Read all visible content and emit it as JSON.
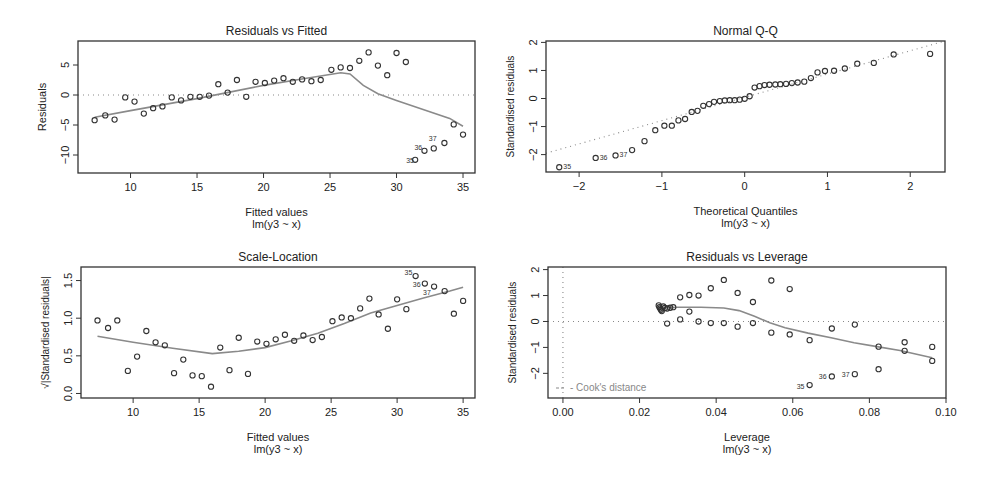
{
  "chart_data": [
    {
      "id": "resid_fitted",
      "type": "scatter",
      "title": "Residuals vs Fitted",
      "xlabel": "Fitted values",
      "sublabel": "lm(y3 ~ x)",
      "ylabel": "Residuals",
      "frame": {
        "left": 78,
        "top": 41,
        "right": 475,
        "bottom": 173
      },
      "xlim": [
        6.05,
        35.9
      ],
      "ylim": [
        -13,
        9
      ],
      "xticks": [
        10,
        15,
        20,
        25,
        30,
        35
      ],
      "yticks": [
        5,
        0,
        -5,
        -10
      ],
      "ytick_labels": [
        "5",
        "0",
        "-5",
        "-10"
      ],
      "hline": 0,
      "points": [
        [
          7.3,
          -4.2
        ],
        [
          8.1,
          -3.4
        ],
        [
          8.8,
          -4.1
        ],
        [
          9.6,
          -0.4
        ],
        [
          10.3,
          -1.1
        ],
        [
          11.0,
          -3.1
        ],
        [
          11.7,
          -2.2
        ],
        [
          12.4,
          -1.9
        ],
        [
          13.1,
          -0.4
        ],
        [
          13.8,
          -0.9
        ],
        [
          14.5,
          -0.3
        ],
        [
          15.2,
          -0.3
        ],
        [
          15.9,
          -0.1
        ],
        [
          16.6,
          1.8
        ],
        [
          17.3,
          0.4
        ],
        [
          18.0,
          2.5
        ],
        [
          18.7,
          -0.3
        ],
        [
          19.4,
          2.2
        ],
        [
          20.1,
          2.0
        ],
        [
          20.8,
          2.4
        ],
        [
          21.5,
          2.8
        ],
        [
          22.2,
          2.2
        ],
        [
          22.9,
          2.6
        ],
        [
          23.6,
          2.3
        ],
        [
          24.3,
          2.5
        ],
        [
          25.1,
          4.2
        ],
        [
          25.8,
          4.6
        ],
        [
          26.5,
          4.5
        ],
        [
          27.2,
          5.7
        ],
        [
          27.9,
          7.1
        ],
        [
          28.6,
          4.9
        ],
        [
          29.3,
          3.3
        ],
        [
          30.0,
          7.0
        ],
        [
          30.7,
          5.5
        ],
        [
          31.4,
          -10.8
        ],
        [
          32.1,
          -9.3
        ],
        [
          32.8,
          -8.9
        ],
        [
          33.6,
          -8.0
        ],
        [
          34.3,
          -4.9
        ],
        [
          35.0,
          -6.6
        ]
      ],
      "labels": [
        {
          "idx": 34,
          "text": "35",
          "dx": -9,
          "dy": 3
        },
        {
          "idx": 35,
          "text": "36",
          "dx": -10,
          "dy": -1
        },
        {
          "idx": 36,
          "text": "37",
          "dx": -5,
          "dy": -7
        }
      ],
      "smooth": [
        [
          7.3,
          -3.7
        ],
        [
          10,
          -2.6
        ],
        [
          15,
          -0.6
        ],
        [
          20,
          1.6
        ],
        [
          23,
          2.7
        ],
        [
          25.8,
          3.7
        ],
        [
          26.5,
          3.5
        ],
        [
          27.5,
          1.6
        ],
        [
          28.6,
          0.2
        ],
        [
          30,
          -0.9
        ],
        [
          32,
          -2.4
        ],
        [
          34,
          -3.9
        ],
        [
          35,
          -5.2
        ]
      ]
    },
    {
      "id": "normal_qq",
      "type": "scatter",
      "title": "Normal Q-Q",
      "xlabel": "Theoretical Quantiles",
      "sublabel": "lm(y3 ~ x)",
      "ylabel": "Standardised residuals",
      "frame": {
        "left": 546,
        "top": 41,
        "right": 945,
        "bottom": 172
      },
      "xlim": [
        -2.4,
        2.42
      ],
      "ylim": [
        -2.62,
        2.05
      ],
      "xticks": [
        -2,
        -1,
        0,
        1,
        2
      ],
      "yticks": [
        2,
        1,
        0,
        -1,
        -2
      ],
      "ytick_labels": [
        "2",
        "1",
        "0",
        "-1",
        "-2"
      ],
      "refline": [
        [
          -2.4,
          -1.95
        ],
        [
          2.42,
          2.05
        ]
      ],
      "points": [
        [
          -2.24,
          -2.45
        ],
        [
          -1.8,
          -2.12
        ],
        [
          -1.56,
          -2.03
        ],
        [
          -1.36,
          -1.84
        ],
        [
          -1.21,
          -1.52
        ],
        [
          -1.08,
          -1.13
        ],
        [
          -0.97,
          -0.97
        ],
        [
          -0.88,
          -0.97
        ],
        [
          -0.8,
          -0.78
        ],
        [
          -0.72,
          -0.73
        ],
        [
          -0.64,
          -0.48
        ],
        [
          -0.57,
          -0.44
        ],
        [
          -0.5,
          -0.26
        ],
        [
          -0.43,
          -0.2
        ],
        [
          -0.37,
          -0.12
        ],
        [
          -0.3,
          -0.09
        ],
        [
          -0.24,
          -0.07
        ],
        [
          -0.18,
          -0.06
        ],
        [
          -0.12,
          -0.06
        ],
        [
          -0.06,
          -0.04
        ],
        [
          0.0,
          -0.01
        ],
        [
          0.06,
          0.08
        ],
        [
          0.12,
          0.39
        ],
        [
          0.18,
          0.44
        ],
        [
          0.24,
          0.48
        ],
        [
          0.3,
          0.49
        ],
        [
          0.37,
          0.5
        ],
        [
          0.43,
          0.51
        ],
        [
          0.5,
          0.52
        ],
        [
          0.57,
          0.55
        ],
        [
          0.64,
          0.57
        ],
        [
          0.72,
          0.6
        ],
        [
          0.8,
          0.73
        ],
        [
          0.88,
          0.93
        ],
        [
          0.97,
          0.98
        ],
        [
          1.08,
          0.99
        ],
        [
          1.21,
          1.07
        ],
        [
          1.36,
          1.24
        ],
        [
          1.56,
          1.27
        ],
        [
          1.8,
          1.57
        ],
        [
          2.24,
          1.59
        ]
      ],
      "labels": [
        {
          "idx": 0,
          "text": "35",
          "dx": 4,
          "dy": 2
        },
        {
          "idx": 1,
          "text": "36",
          "dx": 4,
          "dy": 2
        },
        {
          "idx": 2,
          "text": "37",
          "dx": 4,
          "dy": 2
        }
      ]
    },
    {
      "id": "scale_location",
      "type": "scatter",
      "title": "Scale-Location",
      "xlabel": "Fitted values",
      "sublabel": "lm(y3 ~ x)",
      "ylabel": "√|Standardised residuals|",
      "frame": {
        "left": 81,
        "top": 267,
        "right": 475,
        "bottom": 398
      },
      "xlim": [
        6.05,
        35.9
      ],
      "ylim": [
        -0.06,
        1.68
      ],
      "xticks": [
        10,
        15,
        20,
        25,
        30,
        35
      ],
      "yticks": [
        0.0,
        0.5,
        1.0,
        1.5
      ],
      "ytick_labels": [
        "0.0",
        "0.5",
        "1.0",
        "1.5"
      ],
      "points": [
        [
          7.3,
          0.97
        ],
        [
          8.1,
          0.87
        ],
        [
          8.8,
          0.97
        ],
        [
          9.6,
          0.3
        ],
        [
          10.3,
          0.49
        ],
        [
          11.0,
          0.83
        ],
        [
          11.7,
          0.68
        ],
        [
          12.4,
          0.64
        ],
        [
          13.1,
          0.27
        ],
        [
          13.8,
          0.45
        ],
        [
          14.5,
          0.24
        ],
        [
          15.2,
          0.23
        ],
        [
          15.9,
          0.09
        ],
        [
          16.6,
          0.61
        ],
        [
          17.3,
          0.31
        ],
        [
          18.0,
          0.74
        ],
        [
          18.7,
          0.26
        ],
        [
          19.4,
          0.69
        ],
        [
          20.1,
          0.66
        ],
        [
          20.8,
          0.72
        ],
        [
          21.5,
          0.78
        ],
        [
          22.2,
          0.7
        ],
        [
          22.9,
          0.77
        ],
        [
          23.6,
          0.71
        ],
        [
          24.3,
          0.75
        ],
        [
          25.1,
          0.96
        ],
        [
          25.8,
          1.01
        ],
        [
          26.5,
          1.0
        ],
        [
          27.2,
          1.13
        ],
        [
          27.9,
          1.26
        ],
        [
          28.6,
          1.05
        ],
        [
          29.3,
          0.86
        ],
        [
          30.0,
          1.25
        ],
        [
          30.7,
          1.12
        ],
        [
          31.4,
          1.56
        ],
        [
          32.1,
          1.46
        ],
        [
          32.8,
          1.42
        ],
        [
          33.6,
          1.36
        ],
        [
          34.3,
          1.06
        ],
        [
          35.0,
          1.23
        ]
      ],
      "labels": [
        {
          "idx": 34,
          "text": "35",
          "dx": -11,
          "dy": -1
        },
        {
          "idx": 35,
          "text": "36",
          "dx": -12,
          "dy": 3
        },
        {
          "idx": 36,
          "text": "37",
          "dx": -11,
          "dy": 8
        }
      ],
      "smooth": [
        [
          7.3,
          0.76
        ],
        [
          10,
          0.68
        ],
        [
          13,
          0.6
        ],
        [
          16,
          0.53
        ],
        [
          18,
          0.56
        ],
        [
          20,
          0.61
        ],
        [
          22,
          0.7
        ],
        [
          24,
          0.8
        ],
        [
          26,
          0.93
        ],
        [
          28,
          1.07
        ],
        [
          30,
          1.17
        ],
        [
          32,
          1.27
        ],
        [
          34,
          1.36
        ],
        [
          35,
          1.41
        ]
      ]
    },
    {
      "id": "resid_leverage",
      "type": "scatter",
      "title": "Residuals vs Leverage",
      "xlabel": "Leverage",
      "sublabel": "lm(y3 ~ x)",
      "ylabel": "Standardised residuals",
      "frame": {
        "left": 548,
        "top": 267,
        "right": 946,
        "bottom": 398
      },
      "xlim": [
        -0.0039,
        0.1
      ],
      "ylim": [
        -2.95,
        2.1
      ],
      "xticks": [
        0.0,
        0.02,
        0.04,
        0.06,
        0.08,
        0.1
      ],
      "xtick_labels": [
        "0.00",
        "0.02",
        "0.04",
        "0.06",
        "0.08",
        "0.10"
      ],
      "yticks": [
        2,
        1,
        0,
        -1,
        -2
      ],
      "ytick_labels": [
        "2",
        "1",
        "0",
        "-1",
        "-2"
      ],
      "hline": 0,
      "vline": 0,
      "legend": "Cook's distance",
      "points": [
        [
          0.025,
          0.62
        ],
        [
          0.0252,
          0.55
        ],
        [
          0.0254,
          0.5
        ],
        [
          0.0256,
          0.45
        ],
        [
          0.0258,
          0.4
        ],
        [
          0.0262,
          0.58
        ],
        [
          0.0266,
          0.52
        ],
        [
          0.0272,
          0.5
        ],
        [
          0.028,
          0.53
        ],
        [
          0.0288,
          0.55
        ],
        [
          0.0272,
          -0.08
        ],
        [
          0.0306,
          0.93
        ],
        [
          0.0306,
          0.08
        ],
        [
          0.033,
          1.02
        ],
        [
          0.033,
          0.38
        ],
        [
          0.0354,
          1.0
        ],
        [
          0.0354,
          0.0
        ],
        [
          0.0386,
          1.28
        ],
        [
          0.0386,
          -0.06
        ],
        [
          0.042,
          1.6
        ],
        [
          0.042,
          -0.06
        ],
        [
          0.0456,
          1.1
        ],
        [
          0.0456,
          -0.2
        ],
        [
          0.0496,
          0.75
        ],
        [
          0.0496,
          -0.06
        ],
        [
          0.0544,
          1.58
        ],
        [
          0.0544,
          -0.43
        ],
        [
          0.0592,
          1.25
        ],
        [
          0.0592,
          -0.5
        ],
        [
          0.0644,
          -0.72
        ],
        [
          0.0644,
          -2.45
        ],
        [
          0.0702,
          -0.27
        ],
        [
          0.0702,
          -2.12
        ],
        [
          0.0762,
          -0.12
        ],
        [
          0.0762,
          -2.03
        ],
        [
          0.0824,
          -0.97
        ],
        [
          0.0824,
          -1.84
        ],
        [
          0.0892,
          -0.8
        ],
        [
          0.0892,
          -1.13
        ],
        [
          0.0964,
          -0.98
        ],
        [
          0.0964,
          -1.52
        ]
      ],
      "labels": [
        {
          "idx": 30,
          "text": "35",
          "dx": -13,
          "dy": 4
        },
        {
          "idx": 32,
          "text": "36",
          "dx": -13,
          "dy": 3
        },
        {
          "idx": 34,
          "text": "37",
          "dx": -13,
          "dy": 3
        }
      ],
      "smooth": [
        [
          0.025,
          0.52
        ],
        [
          0.03,
          0.55
        ],
        [
          0.036,
          0.55
        ],
        [
          0.042,
          0.52
        ],
        [
          0.046,
          0.42
        ],
        [
          0.05,
          0.2
        ],
        [
          0.054,
          -0.05
        ],
        [
          0.058,
          -0.24
        ],
        [
          0.064,
          -0.45
        ],
        [
          0.07,
          -0.63
        ],
        [
          0.076,
          -0.82
        ],
        [
          0.082,
          -0.97
        ],
        [
          0.088,
          -1.12
        ],
        [
          0.0964,
          -1.4
        ]
      ]
    }
  ]
}
